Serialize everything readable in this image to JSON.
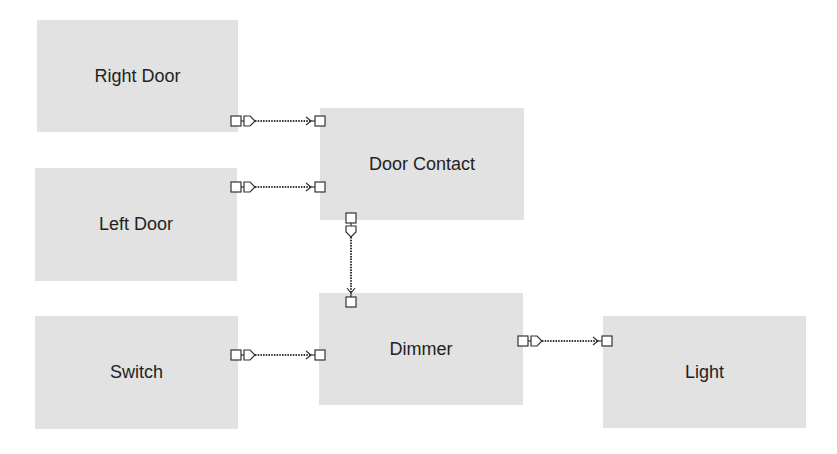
{
  "diagram": {
    "colors": {
      "block_fill": "#e2e2e2",
      "stroke": "#333333",
      "background": "#ffffff"
    },
    "blocks": [
      {
        "id": "right-door",
        "label": "Right Door",
        "x": 37,
        "y": 20,
        "w": 201,
        "h": 112
      },
      {
        "id": "left-door",
        "label": "Left Door",
        "x": 35,
        "y": 168,
        "w": 202,
        "h": 113
      },
      {
        "id": "switch",
        "label": "Switch",
        "x": 35,
        "y": 316,
        "w": 203,
        "h": 113
      },
      {
        "id": "door-contact",
        "label": "Door Contact",
        "x": 320,
        "y": 108,
        "w": 204,
        "h": 112
      },
      {
        "id": "dimmer",
        "label": "Dimmer",
        "x": 319,
        "y": 293,
        "w": 204,
        "h": 112
      },
      {
        "id": "light",
        "label": "Light",
        "x": 603,
        "y": 316,
        "w": 203,
        "h": 112
      }
    ],
    "connections": [
      {
        "from": "Right Door",
        "to": "Door Contact",
        "direction": "horizontal"
      },
      {
        "from": "Left Door",
        "to": "Door Contact",
        "direction": "horizontal"
      },
      {
        "from": "Door Contact",
        "to": "Dimmer",
        "direction": "vertical"
      },
      {
        "from": "Switch",
        "to": "Dimmer",
        "direction": "horizontal"
      },
      {
        "from": "Dimmer",
        "to": "Light",
        "direction": "horizontal"
      }
    ]
  }
}
